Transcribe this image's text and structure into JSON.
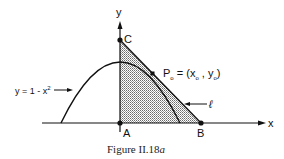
{
  "figure": {
    "caption_prefix": "Figure II.18",
    "caption_suffix": "a",
    "axes": {
      "x_label": "x",
      "y_label": "y"
    },
    "points": {
      "A": "A",
      "B": "B",
      "C": "C",
      "P0": "P"
    },
    "p0_label": {
      "name": "P",
      "sub": "o",
      "eq": " = (",
      "x": "x",
      "x_sub": "o",
      "comma": " , ",
      "y": "y",
      "y_sub": "o",
      "close": ")"
    },
    "curve_label": {
      "text": "y = 1 - x",
      "exp": "2"
    },
    "line_label": "ℓ",
    "colors": {
      "ink": "#111111",
      "shade": "#888888",
      "background": "#ffffff"
    }
  }
}
